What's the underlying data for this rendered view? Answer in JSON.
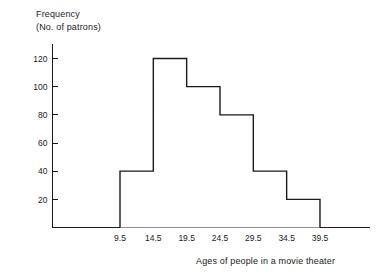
{
  "chart_data": {
    "type": "bar",
    "title": "",
    "subtitle": "",
    "ylabel_line1": "Frequency",
    "ylabel_line2": "(No. of patrons)",
    "xlabel": "Ages of people in a movie theater",
    "bin_edges": [
      9.5,
      14.5,
      19.5,
      24.5,
      29.5,
      34.5,
      39.5
    ],
    "categories": [
      "9.5-14.5",
      "14.5-19.5",
      "19.5-24.5",
      "24.5-29.5",
      "29.5-34.5",
      "34.5-39.5"
    ],
    "values": [
      40,
      120,
      100,
      80,
      40,
      20
    ],
    "x_tick_labels": [
      "9.5",
      "14.5",
      "19.5",
      "24.5",
      "29.5",
      "34.5",
      "39.5"
    ],
    "y_tick_labels": [
      "20",
      "40",
      "60",
      "80",
      "100",
      "120"
    ],
    "y_tick_values": [
      20,
      40,
      60,
      80,
      100,
      120
    ],
    "xlim": [
      4.5,
      44.5
    ],
    "ylim": [
      0,
      130
    ],
    "grid": false,
    "legend": null,
    "line_color": "#1a1a1a",
    "fill_color": "#ffffff",
    "background_color": "#ffffff"
  }
}
